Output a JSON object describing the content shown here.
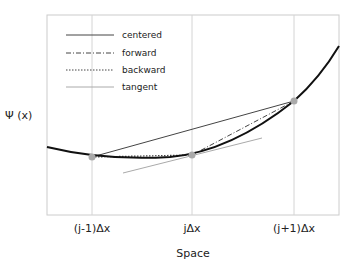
{
  "diagram": {
    "ylabel": "Ψ (x)",
    "xlabel": "Space",
    "xticks": [
      "(j-1)Δx",
      "jΔx",
      "(j+1)Δx"
    ],
    "legend": [
      {
        "label": "centered",
        "style": "solid",
        "color": "#444444"
      },
      {
        "label": "forward",
        "style": "dashdot",
        "color": "#444444"
      },
      {
        "label": "backward",
        "style": "dotted",
        "color": "#444444"
      },
      {
        "label": "tangent",
        "style": "solid",
        "color": "#aaaaaa"
      }
    ],
    "colors": {
      "curve": "#111111",
      "points": "#aaaaaa",
      "grid": "#cccccc",
      "frame": "#cccccc"
    }
  }
}
